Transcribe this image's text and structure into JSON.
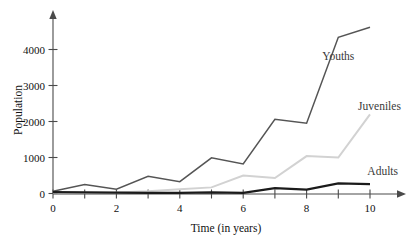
{
  "chart_data": {
    "type": "line",
    "title": "",
    "xlabel": "Time (in years)",
    "ylabel": "Population",
    "x": [
      0,
      1,
      2,
      3,
      4,
      5,
      6,
      7,
      8,
      9,
      10
    ],
    "xlim": [
      0,
      10
    ],
    "ylim": [
      0,
      4800
    ],
    "xticks": [
      0,
      1,
      2,
      3,
      4,
      5,
      6,
      7,
      8,
      9,
      10
    ],
    "xticklabels": [
      "0",
      "",
      "2",
      "",
      "4",
      "",
      "6",
      "",
      "8",
      "",
      "10"
    ],
    "yticks": [
      0,
      1000,
      2000,
      3000,
      4000
    ],
    "yticklabels": [
      "0",
      "1000",
      "2000",
      "3000",
      "4000"
    ],
    "grid": false,
    "legend": "inline-annotations",
    "series": [
      {
        "name": "Youths",
        "color": "#555555",
        "width": 1.5,
        "values": [
          60,
          250,
          120,
          480,
          330,
          990,
          820,
          2060,
          1950,
          4340,
          4620
        ],
        "label_x": 9.0,
        "label_y": 3700
      },
      {
        "name": "Juveniles",
        "color": "#d2d2d2",
        "width": 2.0,
        "values": [
          20,
          20,
          30,
          60,
          120,
          170,
          500,
          430,
          1040,
          1000,
          2200
        ],
        "label_x": 10.3,
        "label_y": 2320
      },
      {
        "name": "Adults",
        "color": "#1b1b1b",
        "width": 2.2,
        "values": [
          40,
          30,
          25,
          20,
          20,
          30,
          20,
          150,
          110,
          280,
          260
        ],
        "label_x": 10.4,
        "label_y": 520
      }
    ]
  },
  "axes": {
    "y_axis_title": "Population",
    "x_axis_title": "Time (in years)"
  }
}
